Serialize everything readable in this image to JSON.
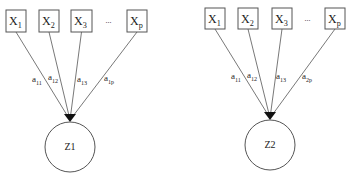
{
  "diagrams": [
    {
      "name": "factor-Z1",
      "factor": {
        "label": "Z1",
        "cx": 70,
        "cy": 147,
        "r": 25
      },
      "indicators": [
        {
          "base": "X",
          "sub": "1",
          "x": 6,
          "y": 10,
          "w": 20,
          "h": 22
        },
        {
          "base": "X",
          "sub": "2",
          "x": 39,
          "y": 10,
          "w": 20,
          "h": 22
        },
        {
          "base": "X",
          "sub": "3",
          "x": 71,
          "y": 10,
          "w": 21,
          "h": 22
        },
        {
          "base": "X",
          "sub": "p",
          "x": 127,
          "y": 10,
          "w": 20,
          "h": 22
        }
      ],
      "ellipsis": "...",
      "loadings": [
        {
          "base": "a",
          "sub": "11",
          "x": 32,
          "y": 82
        },
        {
          "base": "a",
          "sub": "12",
          "x": 48,
          "y": 80
        },
        {
          "base": "a",
          "sub": "13",
          "x": 77,
          "y": 82
        },
        {
          "base": "a",
          "sub": "1p",
          "x": 104,
          "y": 81
        }
      ]
    },
    {
      "name": "factor-Z2",
      "factor": {
        "label": "Z2",
        "cx": 270,
        "cy": 145,
        "r": 25
      },
      "indicators": [
        {
          "base": "X",
          "sub": "1",
          "x": 205,
          "y": 8,
          "w": 20,
          "h": 21
        },
        {
          "base": "X",
          "sub": "2",
          "x": 238,
          "y": 8,
          "w": 20,
          "h": 21
        },
        {
          "base": "X",
          "sub": "3",
          "x": 272,
          "y": 8,
          "w": 20,
          "h": 21
        },
        {
          "base": "X",
          "sub": "p",
          "x": 325,
          "y": 8,
          "w": 20,
          "h": 21
        }
      ],
      "ellipsis": "...",
      "loadings": [
        {
          "base": "a",
          "sub": "11",
          "x": 231,
          "y": 79
        },
        {
          "base": "a",
          "sub": "12",
          "x": 247,
          "y": 78
        },
        {
          "base": "a",
          "sub": "13",
          "x": 276,
          "y": 79
        },
        {
          "base": "a",
          "sub": "2p",
          "x": 302,
          "y": 79
        }
      ]
    }
  ]
}
